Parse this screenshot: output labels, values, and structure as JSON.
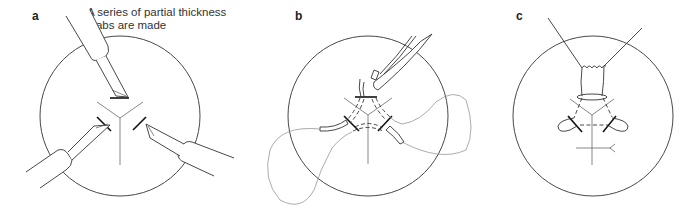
{
  "figure": {
    "panels": [
      {
        "id": "a",
        "label": "a",
        "caption_line1": "A series of partial thickness",
        "caption_line2": "stabs are made"
      },
      {
        "id": "b",
        "label": "b"
      },
      {
        "id": "c",
        "label": "c"
      }
    ]
  }
}
